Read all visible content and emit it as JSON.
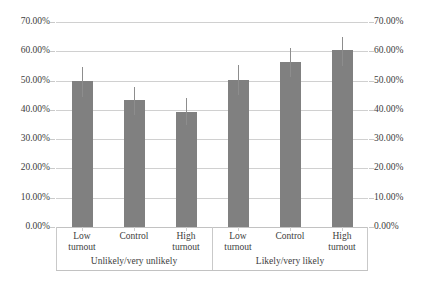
{
  "chart_data": {
    "type": "bar",
    "title": "",
    "xlabel": "",
    "ylabel": "",
    "ylim": [
      0,
      70
    ],
    "grid": true,
    "legend": "none",
    "dual_axis": true,
    "value_suffix": "%",
    "y_ticks": [
      "0.00%",
      "10.00%",
      "20.00%",
      "30.00%",
      "40.00%",
      "50.00%",
      "60.00%",
      "70.00%"
    ],
    "y_tick_values": [
      0,
      10,
      20,
      30,
      40,
      50,
      60,
      70
    ],
    "categories": [
      "Low turnout",
      "Control",
      "High turnout"
    ],
    "groups": [
      {
        "label": "Unlikely/very unlikely",
        "bars": [
          {
            "category_line1": "Low",
            "category_line2": "turnout",
            "value": 49.7,
            "ci_low": 44.3,
            "ci_high": 54.5
          },
          {
            "category_line1": "Control",
            "category_line2": "",
            "value": 43.4,
            "ci_low": 38.4,
            "ci_high": 47.9
          },
          {
            "category_line1": "High",
            "category_line2": "turnout",
            "value": 39.4,
            "ci_low": 34.8,
            "ci_high": 44.1
          }
        ]
      },
      {
        "label": "Likely/very likely",
        "bars": [
          {
            "category_line1": "Low",
            "category_line2": "turnout",
            "value": 50.2,
            "ci_low": 45.0,
            "ci_high": 55.3
          },
          {
            "category_line1": "Control",
            "category_line2": "",
            "value": 56.4,
            "ci_low": 51.2,
            "ci_high": 61.1
          },
          {
            "category_line1": "High",
            "category_line2": "turnout",
            "value": 60.3,
            "ci_low": 55.1,
            "ci_high": 64.9
          }
        ]
      }
    ],
    "colors": {
      "bar": "#808080",
      "errorbar": "#8d8d8d",
      "gridline": "#d0d0d0",
      "axis": "#c2c2c2",
      "text": "#3d3d3d",
      "background": "#ffffff"
    }
  }
}
